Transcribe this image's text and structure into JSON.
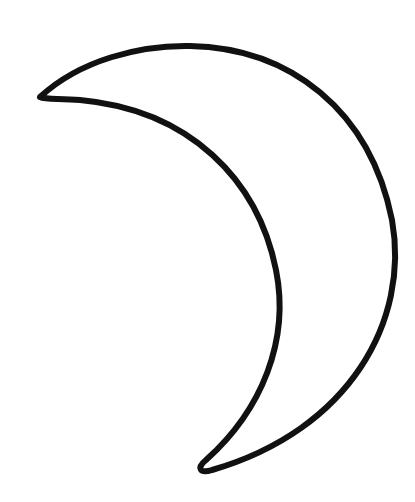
{
  "image": {
    "subject": "crescent-moon-outline",
    "background_color": "#ffffff",
    "stroke_color": "#111111",
    "fill_color": "#ffffff"
  }
}
